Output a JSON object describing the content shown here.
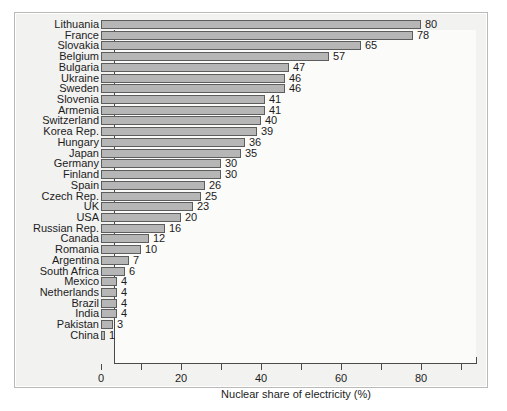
{
  "chart_data": {
    "type": "bar",
    "orientation": "horizontal",
    "title": "",
    "xlabel": "Nuclear share of electricity (%)",
    "ylabel": "",
    "xlim": [
      0,
      90
    ],
    "xticks": [
      0,
      10,
      20,
      30,
      40,
      50,
      60,
      70,
      80,
      90
    ],
    "xtick_labels": [
      "0",
      "",
      "20",
      "",
      "40",
      "",
      "60",
      "",
      "80",
      ""
    ],
    "grid": false,
    "legend": null,
    "bar_color": "#b6b6b6",
    "bar_edge_color": "#5d5d5d",
    "value_labels": true,
    "categories": [
      "Lithuania",
      "France",
      "Slovakia",
      "Belgium",
      "Bulgaria",
      "Ukraine",
      "Sweden",
      "Slovenia",
      "Armenia",
      "Switzerland",
      "Korea Rep.",
      "Hungary",
      "Japan",
      "Germany",
      "Finland",
      "Spain",
      "Czech Rep.",
      "UK",
      "USA",
      "Russian Rep.",
      "Canada",
      "Romania",
      "Argentina",
      "South Africa",
      "Mexico",
      "Netherlands",
      "Brazil",
      "India",
      "Pakistan",
      "China"
    ],
    "values": [
      80,
      78,
      65,
      57,
      47,
      46,
      46,
      41,
      41,
      40,
      39,
      36,
      35,
      30,
      30,
      26,
      25,
      23,
      20,
      16,
      12,
      10,
      7,
      6,
      4,
      4,
      4,
      4,
      3,
      1
    ]
  }
}
